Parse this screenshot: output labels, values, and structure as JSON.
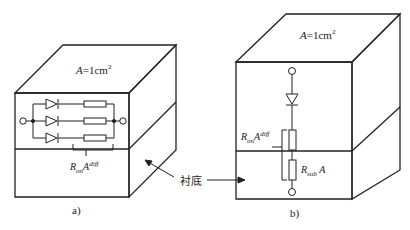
{
  "figure_a": {
    "area_label_var": "A",
    "area_label_rest": "=1cm",
    "area_label_sup": "2",
    "resistance_var": "R",
    "resistance_sub": "on",
    "resistance_var2": "A",
    "resistance_sup": "diff",
    "substrate_label": "衬底",
    "caption": "a)",
    "parallel_branches": 3
  },
  "figure_b": {
    "area_label_var": "A",
    "area_label_rest": "=1cm",
    "area_label_sup": "2",
    "ron_var": "R",
    "ron_sub": "on",
    "ron_var2": "A",
    "ron_sup": "diff",
    "rsub_var": "R",
    "rsub_sub": "sub",
    "rsub_var2": "A",
    "caption": "b)"
  },
  "colors": {
    "line": "#222222",
    "background": "#ffffff"
  }
}
